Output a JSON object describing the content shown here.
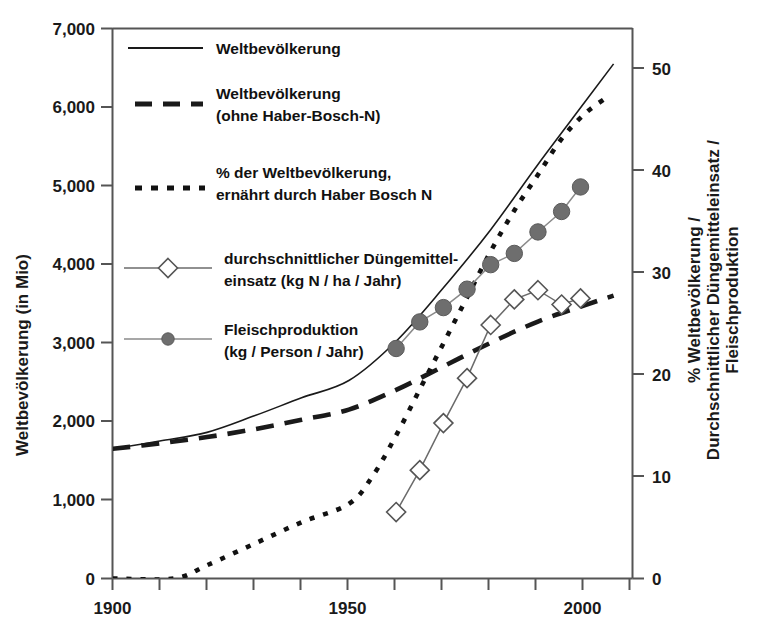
{
  "chart_data": {
    "type": "line",
    "title": "",
    "xlabel": "",
    "ylabel": "Weltbevölkerung (in Mio)",
    "ylabel_right": "% Weltbevölkerung / Durchschnittlicher Düngemitteleinsatz / Fleischproduktion",
    "xlim": [
      1900,
      2010
    ],
    "ylim": [
      0,
      7000
    ],
    "ylim_right": [
      0,
      53.8
    ],
    "grid": false,
    "legend_position": "upper-left-inside",
    "x_ticks": [
      1900,
      1910,
      1920,
      1930,
      1940,
      1950,
      1960,
      1970,
      1980,
      1990,
      2000,
      2010
    ],
    "x_tick_labels": [
      "1900",
      "",
      "",
      "",
      "",
      "1950",
      "",
      "",
      "",
      "",
      "2000",
      ""
    ],
    "y_ticks": [
      0,
      1000,
      2000,
      3000,
      4000,
      5000,
      6000,
      7000
    ],
    "y_tick_labels": [
      "0",
      "1,000",
      "2,000",
      "3,000",
      "4,000",
      "5,000",
      "6,000",
      "7,000"
    ],
    "y_right_ticks": [
      0,
      10,
      20,
      30,
      40,
      50
    ],
    "y_right_tick_labels": [
      "0",
      "10",
      "20",
      "30",
      "40",
      "50"
    ],
    "series": [
      {
        "name": "Weltbevölkerung",
        "style": "solid",
        "axis": "left",
        "color": "#1a1a1a",
        "x": [
          1900,
          1910,
          1920,
          1930,
          1940,
          1950,
          1960,
          1970,
          1980,
          1990,
          2000,
          2006
        ],
        "values": [
          1650,
          1750,
          1860,
          2070,
          2300,
          2520,
          3020,
          3700,
          4440,
          5270,
          6070,
          6550
        ]
      },
      {
        "name": "Weltbevölkerung (ohne Haber-Bosch-N)",
        "style": "dashed",
        "axis": "left",
        "color": "#1a1a1a",
        "x": [
          1900,
          1910,
          1920,
          1930,
          1940,
          1950,
          1960,
          1970,
          1980,
          1990,
          2000,
          2006
        ],
        "values": [
          1650,
          1720,
          1800,
          1900,
          2020,
          2150,
          2400,
          2700,
          3000,
          3270,
          3480,
          3600
        ]
      },
      {
        "name": "% der Weltbevölkerung, ernährt durch Haber Bosch N",
        "style": "dotted",
        "axis": "right",
        "color": "#111111",
        "x": [
          1900,
          1913,
          1920,
          1930,
          1940,
          1950,
          1955,
          1960,
          1965,
          1970,
          1975,
          1980,
          1985,
          1990,
          1995,
          2000,
          2005
        ],
        "values": [
          0,
          0,
          1.3,
          3.4,
          5.5,
          7.3,
          10.0,
          14.0,
          18.5,
          23.0,
          27.5,
          32.0,
          36.0,
          39.5,
          43.0,
          45.5,
          47.2
        ]
      },
      {
        "name": "durchschnittlicher Düngemitteleinsatz (kg N / ha / Jahr)",
        "style": "solid-diamond",
        "axis": "right",
        "color": "#4a4a4a",
        "x": [
          1960,
          1965,
          1970,
          1975,
          1980,
          1985,
          1990,
          1995,
          1999
        ],
        "values": [
          6.5,
          10.6,
          15.2,
          19.6,
          24.8,
          27.3,
          28.2,
          26.8,
          27.4
        ]
      },
      {
        "name": "Fleischproduktion (kg / Person / Jahr)",
        "style": "solid-circle",
        "axis": "right",
        "color": "#6e6e6e",
        "x": [
          1960,
          1965,
          1970,
          1975,
          1980,
          1985,
          1990,
          1995,
          1999
        ],
        "values": [
          22.5,
          25.1,
          26.5,
          28.3,
          30.7,
          31.8,
          33.9,
          35.9,
          38.3
        ]
      }
    ],
    "legend": [
      {
        "label_line1": "Weltbevölkerung",
        "label_line2": "",
        "marker": "solid-line"
      },
      {
        "label_line1": "Weltbevölkerung",
        "label_line2": "(ohne Haber-Bosch-N)",
        "marker": "dashed-line"
      },
      {
        "label_line1": "% der Weltbevölkerung,",
        "label_line2": "ernährt durch Haber Bosch N",
        "marker": "dotted-line"
      },
      {
        "label_line1": "durchschnittlicher Düngemittel-",
        "label_line2": "einsatz (kg N / ha / Jahr)",
        "marker": "line-diamond"
      },
      {
        "label_line1": "Fleischproduktion",
        "label_line2": "(kg / Person / Jahr)",
        "marker": "line-circle"
      }
    ]
  },
  "colors": {
    "axis": "#555555",
    "text": "#1a1a1a",
    "series_dark": "#1a1a1a",
    "diamond_fill": "#ffffff",
    "diamond_stroke": "#555555",
    "circle_fill": "#6e6e6e",
    "circle_stroke": "#5a5a5a",
    "background": "#ffffff"
  }
}
